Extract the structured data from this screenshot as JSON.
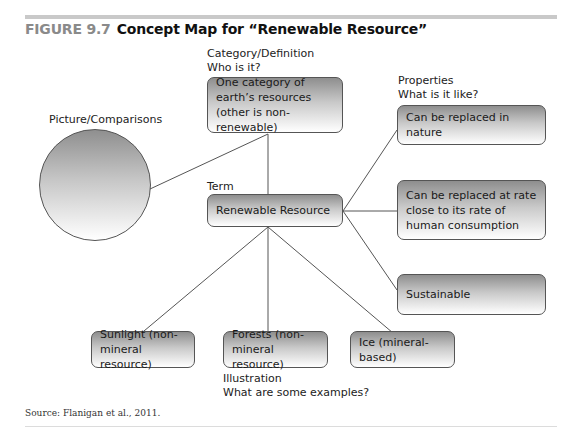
{
  "figure": {
    "number": "FIGURE 9.7",
    "title": "Concept Map for “Renewable Resource”"
  },
  "labels": {
    "category_line1": "Category/Definition",
    "category_line2": "Who is it?",
    "properties_line1": "Properties",
    "properties_line2": "What is it like?",
    "picture": "Picture/Comparisons",
    "term": "Term",
    "illustration_line1": "Illustration",
    "illustration_line2": "What are some examples?"
  },
  "nodes": {
    "category": "One category of earth’s resources (other is non-renewable)",
    "term": "Renewable Resource",
    "properties": [
      "Can be replaced in nature",
      "Can be replaced at rate close to its rate of human consumption",
      "Sustainable"
    ],
    "examples": [
      "Sunlight (non-mineral resource)",
      "Forests (non-mineral resource)",
      "Ice (mineral-based)"
    ]
  },
  "colors": {
    "line": "#555555",
    "node_border": "#555555",
    "gradient_top": "#8e8e8e",
    "gradient_bottom": "#ffffff",
    "figure_number": "#8a8a8a"
  },
  "source": "Source: Flanigan et al., 2011."
}
